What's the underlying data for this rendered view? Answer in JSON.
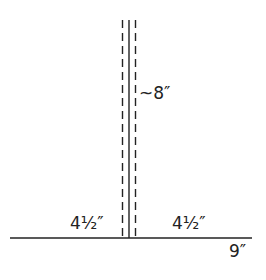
{
  "diagram": {
    "labels": {
      "height": "~8″",
      "left_half": "4½″",
      "right_half": "4½″",
      "total_width": "9″"
    },
    "colors": {
      "line": "#222222",
      "background": "#ffffff"
    }
  }
}
